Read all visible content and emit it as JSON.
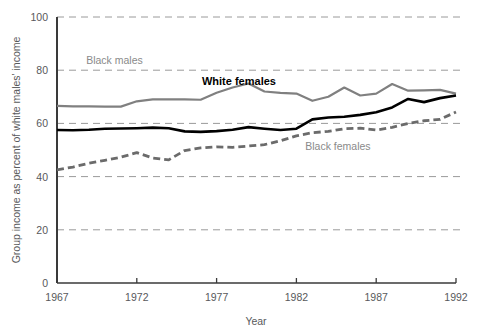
{
  "chart_data": {
    "type": "line",
    "title": "",
    "xlabel": "Year",
    "ylabel": "Group income as percent of white males' income",
    "xlim": [
      1967,
      1992
    ],
    "ylim": [
      0,
      100
    ],
    "xticks": [
      1967,
      1972,
      1977,
      1982,
      1987,
      1992
    ],
    "yticks": [
      0,
      20,
      40,
      60,
      80,
      100
    ],
    "grid": true,
    "gridlines_y": [
      20,
      40,
      60,
      80,
      100
    ],
    "legend_position": "inline-annotations",
    "x": [
      1967,
      1968,
      1969,
      1970,
      1971,
      1972,
      1973,
      1974,
      1975,
      1976,
      1977,
      1978,
      1979,
      1980,
      1981,
      1982,
      1983,
      1984,
      1985,
      1986,
      1987,
      1988,
      1989,
      1990,
      1991,
      1992
    ],
    "series": [
      {
        "name": "Black males",
        "color": "#808080",
        "style": "solid",
        "values": [
          66.6,
          66.4,
          66.4,
          66.3,
          66.3,
          68.3,
          69.0,
          69.0,
          69.0,
          68.9,
          71.5,
          73.5,
          75.0,
          72.0,
          71.5,
          71.2,
          68.5,
          70.0,
          73.5,
          70.5,
          71.2,
          74.8,
          72.3,
          72.4,
          72.6,
          71.2
        ]
      },
      {
        "name": "White females",
        "color": "#000000",
        "style": "solid",
        "values": [
          57.5,
          57.4,
          57.6,
          58.0,
          58.1,
          58.2,
          58.4,
          58.2,
          57.0,
          56.8,
          57.1,
          57.6,
          58.6,
          58.0,
          57.5,
          58.0,
          61.5,
          62.2,
          62.5,
          63.2,
          64.2,
          66.0,
          69.2,
          68.0,
          69.5,
          70.5
        ]
      },
      {
        "name": "Black females",
        "color": "#6b6b6b",
        "style": "dashed",
        "values": [
          42.5,
          43.6,
          45.0,
          46.1,
          47.3,
          49.0,
          47.0,
          46.3,
          49.8,
          50.8,
          51.2,
          51.0,
          51.5,
          52.0,
          53.5,
          55.3,
          56.5,
          57.0,
          58.0,
          58.2,
          57.5,
          58.5,
          60.0,
          61.0,
          61.5,
          64.3
        ]
      }
    ],
    "annotations": [
      {
        "name": "black-males-label",
        "text": "Black males",
        "x": 1970.6,
        "y": 82.5,
        "color": "#8a8a8a"
      },
      {
        "name": "white-females-label",
        "text": "White females",
        "x": 1978.4,
        "y": 74.4,
        "color": "#000000"
      },
      {
        "name": "black-females-label",
        "text": "Black females",
        "x": 1984.6,
        "y": 50.0,
        "color": "#8a8a8a"
      }
    ]
  },
  "axes": {
    "y_tick_labels": [
      "100",
      "80",
      "60",
      "40",
      "20",
      "0"
    ],
    "x_tick_labels": [
      "1967",
      "1972",
      "1977",
      "1982",
      "1987",
      "1992"
    ],
    "x_axis_title": "Year",
    "y_axis_title": "Group income as percent of white males' income"
  },
  "colors": {
    "background": "#ffffff",
    "axis": "#3a3a3a",
    "grid": "#9a9a9a",
    "tick_text": "#58595b",
    "black_males": "#808080",
    "white_females": "#000000",
    "black_females": "#6b6b6b"
  }
}
